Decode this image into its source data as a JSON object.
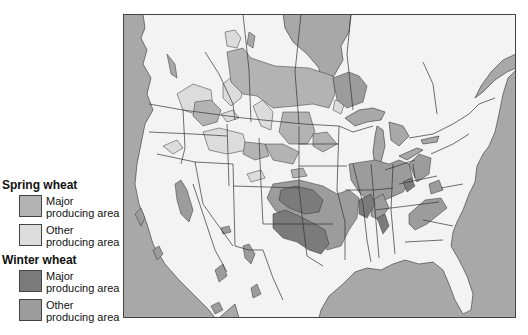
{
  "legend": {
    "groups": [
      {
        "title": "Spring wheat",
        "items": [
          {
            "label_line1": "Major",
            "label_line2": "producing area",
            "color": "#b3b3b3"
          },
          {
            "label_line1": "Other",
            "label_line2": "producing area",
            "color": "#dcdcdc"
          }
        ]
      },
      {
        "title": "Winter wheat",
        "items": [
          {
            "label_line1": "Major",
            "label_line2": "producing area",
            "color": "#7b7b7b"
          },
          {
            "label_line1": "Other",
            "label_line2": "producing area",
            "color": "#9c9c9c"
          }
        ]
      }
    ]
  },
  "map": {
    "subject": "Wheat producing areas of the United States and southern Canada",
    "colors": {
      "water": "#a8a8a8",
      "land": "#f3f3f3",
      "border": "#333333"
    }
  }
}
